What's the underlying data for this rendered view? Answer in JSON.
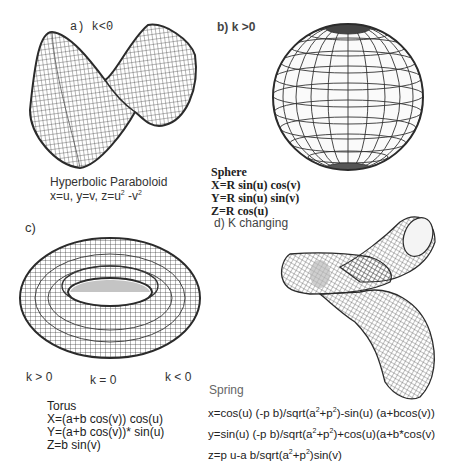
{
  "panels": {
    "a": {
      "label": "a)  k<0",
      "surface": "hyperbolic-paraboloid",
      "title": "Hyperbolic Paraboloid",
      "equation_parts": [
        "x=u, y=v, z=u",
        "2",
        " -v",
        "2"
      ]
    },
    "b": {
      "label": "b) k >0",
      "surface": "sphere",
      "title": "Sphere",
      "equations": [
        "X=R sin(u) cos(v)",
        "Y=R sin(u) sin(v)",
        "Z=R cos(u)"
      ]
    },
    "c": {
      "label": "c)",
      "surface": "torus",
      "curvature_labels": [
        "k > 0",
        "k = 0",
        "k < 0"
      ],
      "title": "Torus",
      "equations": [
        "X=(a+b cos(v)) cos(u)",
        "Y=(a+b cos(v))* sin(u)",
        "Z=b sin(v)"
      ]
    },
    "d": {
      "label": "d) K changing",
      "surface": "spring",
      "title": "Spring",
      "equations": [
        [
          "x=cos(u) (-p b)/sqrt(a",
          "2",
          "+p",
          "2",
          ")-sin(u) (a+bcos(v))"
        ],
        [
          "y=sin(u) (-p b)/sqrt(a",
          "2",
          "+p",
          "2",
          ")+cos(u)(a+b*cos(v)"
        ],
        [
          "z=p u-a b/sqrt(a",
          "2",
          "+p",
          "2",
          ")sin(v)"
        ]
      ]
    }
  },
  "colors": {
    "wire": "#2b2b2b",
    "text": "#222222",
    "background": "#ffffff"
  }
}
